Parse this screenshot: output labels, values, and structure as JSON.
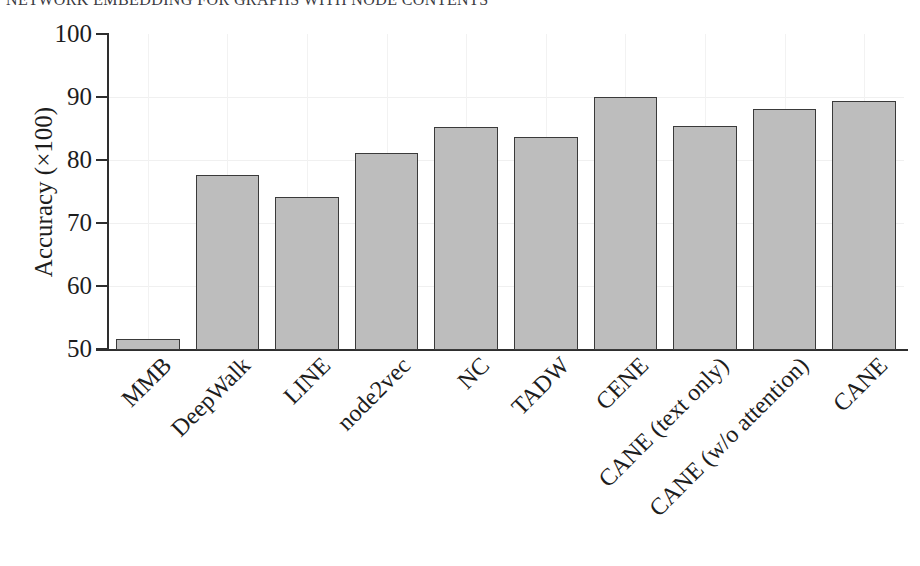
{
  "figure": {
    "clipped_title": "NETWORK EMBEDDING FOR GRAPHS WITH NODE CONTENTS"
  },
  "chart_data": {
    "type": "bar",
    "title": "NETWORK EMBEDDING FOR GRAPHS WITH NODE CONTENTS",
    "xlabel": "",
    "ylabel": "Accuracy (×100)",
    "ylim": [
      50,
      100
    ],
    "yticks": [
      50,
      60,
      70,
      80,
      90,
      100
    ],
    "ytick_labels": [
      "50",
      "60",
      "70",
      "80",
      "90",
      "100"
    ],
    "grid": true,
    "legend": "none",
    "bar_color": "#bdbdbd",
    "bar_edge_color": "#3a3a3a",
    "categories": [
      "MMB",
      "DeepWalk",
      "LINE",
      "node2vec",
      "NC",
      "TADW",
      "CENE",
      "CANE (text only)",
      "CANE (w/o attention)",
      "CANE"
    ],
    "values": [
      51.7,
      77.8,
      74.3,
      81.2,
      85.4,
      83.8,
      90.2,
      85.5,
      88.2,
      89.6
    ]
  }
}
